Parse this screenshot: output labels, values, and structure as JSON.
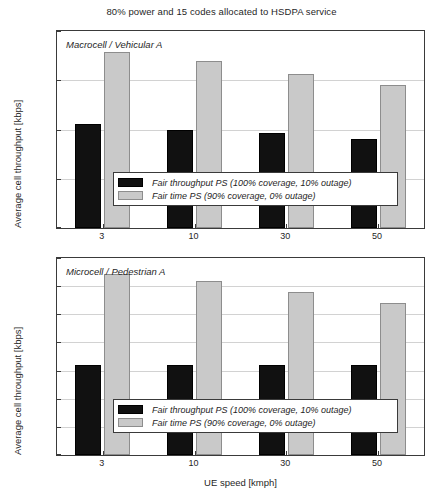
{
  "figure": {
    "title": "80% power and 15 codes allocated to HSDPA service",
    "xlabel": "UE speed [kmph]",
    "ylabel": "Average cell throughput [kbps]",
    "legend": {
      "series1": "Fair throughput PS (100% coverage, 10% outage)",
      "series2": "Fair time PS (90% coverage, 0% outage)"
    },
    "colors": {
      "series1": "#111111",
      "series2": "#c9c9c9",
      "axis": "#3a3a3a",
      "grid": "#d2d2d2"
    }
  },
  "panels": [
    {
      "tag": "Macrocell / Vehicular A",
      "yticks": [
        "0",
        "500",
        "1000",
        "1500",
        "2000"
      ]
    },
    {
      "tag": "Microcell / Pedestrian A",
      "yticks": [
        "0",
        "1000",
        "2000",
        "3000",
        "4000",
        "5000",
        "6000",
        "7000"
      ]
    }
  ],
  "xticks": [
    "3",
    "10",
    "30",
    "50"
  ],
  "chart_data": [
    {
      "type": "bar",
      "title": "Macrocell / Vehicular A",
      "subtitle": "80% power and 15 codes allocated to HSDPA service",
      "xlabel": "UE speed [kmph]",
      "ylabel": "Average cell throughput [kbps]",
      "categories": [
        "3",
        "10",
        "30",
        "50"
      ],
      "ylim": [
        0,
        2000
      ],
      "yticks": [
        0,
        500,
        1000,
        1500,
        2000
      ],
      "grid": true,
      "legend_position": "lower-center",
      "series": [
        {
          "name": "Fair throughput PS (100% coverage, 10% outage)",
          "color": "#111111",
          "values": [
            1060,
            1000,
            965,
            900
          ]
        },
        {
          "name": "Fair time PS (90% coverage, 0% outage)",
          "color": "#c9c9c9",
          "values": [
            1790,
            1700,
            1560,
            1450
          ]
        }
      ]
    },
    {
      "type": "bar",
      "title": "Microcell / Pedestrian A",
      "xlabel": "UE speed [kmph]",
      "ylabel": "Average cell throughput [kbps]",
      "categories": [
        "3",
        "10",
        "30",
        "50"
      ],
      "ylim": [
        0,
        7000
      ],
      "yticks": [
        0,
        1000,
        2000,
        3000,
        4000,
        5000,
        6000,
        7000
      ],
      "grid": true,
      "legend_position": "lower-center",
      "series": [
        {
          "name": "Fair throughput PS (100% coverage, 10% outage)",
          "color": "#111111",
          "values": [
            3200,
            3200,
            3200,
            3200
          ]
        },
        {
          "name": "Fair time PS (90% coverage, 0% outage)",
          "color": "#c9c9c9",
          "values": [
            6440,
            6200,
            5780,
            5400
          ]
        }
      ]
    }
  ]
}
